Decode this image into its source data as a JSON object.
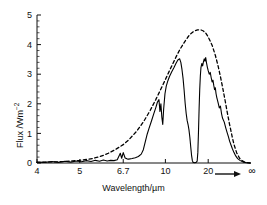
{
  "chart_data": {
    "type": "line",
    "title": "",
    "xlabel": "Wavelength/µm",
    "ylabel": "Flux /Wm⁻²",
    "ylabel_main": "Flux /Wm",
    "ylabel_sup": "−2",
    "xlabel_unit": "µm",
    "x_scale": "reciprocal",
    "x_tick_labels": [
      "4",
      "5",
      "6.7",
      "10",
      "20",
      "∞"
    ],
    "x_tick_values": [
      4,
      5,
      6.7,
      10,
      20,
      1000
    ],
    "xlim": [
      4,
      1000
    ],
    "y_tick_labels": [
      "0",
      "1",
      "2",
      "3",
      "4",
      "5"
    ],
    "y_tick_values": [
      0,
      1,
      2,
      3,
      4,
      5
    ],
    "ylim": [
      0,
      5
    ],
    "y_minor_step": 0.2,
    "grid": false,
    "legend_position": "none",
    "axis_arrow_label": "∞",
    "series": [
      {
        "name": "blackbody-dashed",
        "style": "dashed",
        "color": "#000000",
        "points": [
          [
            4.0,
            0.02
          ],
          [
            4.2,
            0.03
          ],
          [
            4.4,
            0.04
          ],
          [
            4.6,
            0.05
          ],
          [
            4.8,
            0.07
          ],
          [
            5.0,
            0.09
          ],
          [
            5.2,
            0.12
          ],
          [
            5.4,
            0.15
          ],
          [
            5.6,
            0.2
          ],
          [
            5.8,
            0.26
          ],
          [
            6.0,
            0.33
          ],
          [
            6.3,
            0.45
          ],
          [
            6.7,
            0.62
          ],
          [
            7.0,
            0.78
          ],
          [
            7.5,
            1.08
          ],
          [
            8.0,
            1.42
          ],
          [
            8.5,
            1.78
          ],
          [
            9.0,
            2.15
          ],
          [
            9.5,
            2.5
          ],
          [
            10.0,
            2.82
          ],
          [
            10.5,
            3.12
          ],
          [
            11.0,
            3.38
          ],
          [
            11.5,
            3.62
          ],
          [
            12.0,
            3.82
          ],
          [
            12.5,
            3.98
          ],
          [
            13.0,
            4.12
          ],
          [
            13.5,
            4.24
          ],
          [
            14.0,
            4.34
          ],
          [
            15.0,
            4.45
          ],
          [
            16.0,
            4.5
          ],
          [
            17.0,
            4.5
          ],
          [
            18.0,
            4.46
          ],
          [
            19.0,
            4.38
          ],
          [
            20.0,
            4.26
          ],
          [
            22.0,
            3.98
          ],
          [
            24.0,
            3.64
          ],
          [
            26.0,
            3.28
          ],
          [
            28.0,
            2.92
          ],
          [
            30.0,
            2.58
          ],
          [
            33.0,
            2.12
          ],
          [
            36.0,
            1.72
          ],
          [
            40.0,
            1.3
          ],
          [
            45.0,
            0.92
          ],
          [
            50.0,
            0.64
          ],
          [
            60.0,
            0.34
          ],
          [
            75.0,
            0.16
          ],
          [
            100.0,
            0.07
          ],
          [
            160.0,
            0.02
          ],
          [
            1000.0,
            0.0
          ]
        ]
      },
      {
        "name": "observed-solid",
        "style": "solid",
        "color": "#000000",
        "points": [
          [
            4.0,
            0.03
          ],
          [
            4.15,
            0.02
          ],
          [
            4.3,
            0.05
          ],
          [
            4.45,
            0.02
          ],
          [
            4.6,
            0.06
          ],
          [
            4.75,
            0.03
          ],
          [
            4.9,
            0.07
          ],
          [
            5.05,
            0.04
          ],
          [
            5.2,
            0.08
          ],
          [
            5.35,
            0.05
          ],
          [
            5.5,
            0.09
          ],
          [
            5.65,
            0.06
          ],
          [
            5.8,
            0.1
          ],
          [
            5.95,
            0.07
          ],
          [
            6.1,
            0.09
          ],
          [
            6.25,
            0.08
          ],
          [
            6.4,
            0.11
          ],
          [
            6.55,
            0.33
          ],
          [
            6.62,
            0.16
          ],
          [
            6.7,
            0.35
          ],
          [
            6.8,
            0.17
          ],
          [
            6.9,
            0.14
          ],
          [
            7.0,
            0.13
          ],
          [
            7.2,
            0.15
          ],
          [
            7.4,
            0.18
          ],
          [
            7.6,
            0.22
          ],
          [
            7.8,
            0.3
          ],
          [
            7.95,
            0.45
          ],
          [
            8.1,
            0.72
          ],
          [
            8.25,
            0.98
          ],
          [
            8.4,
            1.18
          ],
          [
            8.6,
            1.42
          ],
          [
            8.8,
            1.66
          ],
          [
            9.0,
            1.88
          ],
          [
            9.15,
            2.06
          ],
          [
            9.3,
            2.14
          ],
          [
            9.4,
            1.74
          ],
          [
            9.5,
            2.0
          ],
          [
            9.6,
            1.55
          ],
          [
            9.7,
            1.3
          ],
          [
            9.8,
            1.82
          ],
          [
            9.95,
            2.34
          ],
          [
            10.1,
            2.6
          ],
          [
            10.3,
            2.78
          ],
          [
            10.5,
            2.92
          ],
          [
            10.8,
            3.08
          ],
          [
            11.1,
            3.22
          ],
          [
            11.4,
            3.36
          ],
          [
            11.7,
            3.48
          ],
          [
            12.0,
            3.52
          ],
          [
            12.2,
            3.4
          ],
          [
            12.4,
            3.16
          ],
          [
            12.6,
            2.86
          ],
          [
            12.8,
            2.46
          ],
          [
            13.0,
            2.02
          ],
          [
            13.2,
            1.68
          ],
          [
            13.4,
            1.44
          ],
          [
            13.6,
            1.3
          ],
          [
            13.8,
            1.12
          ],
          [
            14.0,
            0.86
          ],
          [
            14.2,
            0.55
          ],
          [
            14.4,
            0.26
          ],
          [
            14.6,
            0.08
          ],
          [
            14.8,
            0.02
          ],
          [
            15.2,
            0.01
          ],
          [
            15.6,
            0.02
          ],
          [
            15.9,
            0.06
          ],
          [
            16.1,
            0.35
          ],
          [
            16.3,
            1.05
          ],
          [
            16.5,
            1.85
          ],
          [
            16.7,
            2.5
          ],
          [
            16.9,
            2.95
          ],
          [
            17.1,
            3.22
          ],
          [
            17.4,
            3.36
          ],
          [
            17.7,
            3.28
          ],
          [
            18.0,
            3.42
          ],
          [
            18.3,
            3.52
          ],
          [
            18.6,
            3.44
          ],
          [
            18.9,
            3.56
          ],
          [
            19.2,
            3.4
          ],
          [
            19.6,
            3.24
          ],
          [
            20.0,
            3.12
          ],
          [
            20.5,
            3.0
          ],
          [
            21.0,
            3.06
          ],
          [
            21.5,
            2.88
          ],
          [
            22.0,
            2.74
          ],
          [
            22.5,
            2.8
          ],
          [
            23.0,
            2.62
          ],
          [
            23.5,
            2.48
          ],
          [
            24.0,
            2.54
          ],
          [
            24.5,
            2.34
          ],
          [
            25.0,
            2.22
          ],
          [
            26.0,
            2.04
          ],
          [
            27.0,
            1.86
          ],
          [
            28.0,
            1.92
          ],
          [
            29.0,
            1.68
          ],
          [
            30.0,
            1.52
          ],
          [
            32.0,
            1.38
          ],
          [
            34.0,
            1.18
          ],
          [
            36.0,
            1.02
          ],
          [
            38.0,
            0.88
          ],
          [
            40.0,
            0.74
          ],
          [
            43.0,
            0.6
          ],
          [
            46.0,
            0.48
          ],
          [
            50.0,
            0.36
          ],
          [
            56.0,
            0.24
          ],
          [
            64.0,
            0.15
          ],
          [
            80.0,
            0.08
          ],
          [
            110.0,
            0.03
          ],
          [
            200.0,
            0.01
          ],
          [
            1000.0,
            0.0
          ]
        ]
      }
    ]
  }
}
